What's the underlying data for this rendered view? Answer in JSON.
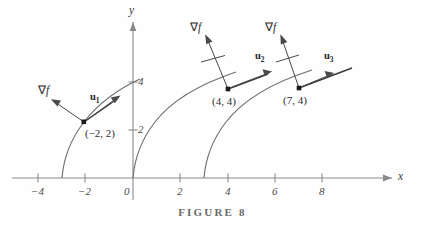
{
  "figure": {
    "caption": "FIGURE 8",
    "axes": {
      "x_label": "x",
      "y_label": "y",
      "x_ticks": [
        {
          "label": "−4",
          "value": -4
        },
        {
          "label": "−2",
          "value": -2
        },
        {
          "label": "0",
          "value": 0
        },
        {
          "label": "2",
          "value": 2
        },
        {
          "label": "4",
          "value": 4
        },
        {
          "label": "6",
          "value": 6
        },
        {
          "label": "8",
          "value": 8
        }
      ],
      "y_ticks": [
        {
          "label": "2",
          "value": 2
        },
        {
          "label": "4",
          "value": 4
        }
      ],
      "xlim": [
        -5.2,
        9.8
      ],
      "ylim": [
        -0.9,
        7.4
      ]
    },
    "gradient_labels": {
      "nabla": "∇",
      "f": "f"
    },
    "vectors": [
      {
        "name": "u1",
        "label": "u",
        "sub": "1"
      },
      {
        "name": "u2",
        "label": "u",
        "sub": "2"
      },
      {
        "name": "u3",
        "label": "u",
        "sub": "3"
      }
    ],
    "points": [
      {
        "name": "point-neg2-2",
        "label": "(−2, 2)",
        "x": -2,
        "y": 2
      },
      {
        "name": "point-4-4",
        "label": "(4, 4)",
        "x": 4,
        "y": 4
      },
      {
        "name": "point-7-4",
        "label": "(7, 4)",
        "x": 7,
        "y": 4
      }
    ],
    "curves": [
      {
        "name": "level-curve-left",
        "x_intercept": -3
      },
      {
        "name": "level-curve-middle",
        "x_intercept": 0
      },
      {
        "name": "level-curve-right",
        "x_intercept": 3
      }
    ],
    "colors": {
      "axis": "#8a8a8a",
      "curve": "#6e6e6e",
      "vector": "#4a4a4a",
      "tangent": "#3a3a3a",
      "text": "#2e2e2e",
      "caption": "#6a6a6a",
      "background": "#fefefe"
    }
  }
}
